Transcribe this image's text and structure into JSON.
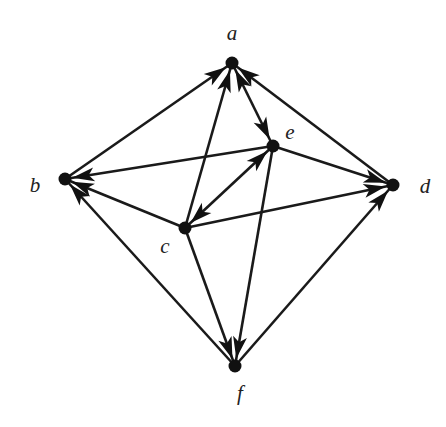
{
  "diagram": {
    "type": "directed-graph",
    "nodes": [
      {
        "id": "a",
        "label": "a",
        "x": 232,
        "y": 63,
        "lx": 232,
        "ly": 40
      },
      {
        "id": "b",
        "label": "b",
        "x": 65,
        "y": 179,
        "lx": 35,
        "ly": 192
      },
      {
        "id": "c",
        "label": "c",
        "x": 185,
        "y": 228,
        "lx": 165,
        "ly": 253
      },
      {
        "id": "d",
        "label": "d",
        "x": 393,
        "y": 185,
        "lx": 425,
        "ly": 193
      },
      {
        "id": "e",
        "label": "e",
        "x": 273,
        "y": 146,
        "lx": 290,
        "ly": 139
      },
      {
        "id": "f",
        "label": "f",
        "x": 235,
        "y": 366,
        "lx": 240,
        "ly": 400
      }
    ],
    "edges": [
      {
        "from": "b",
        "to": "a"
      },
      {
        "from": "c",
        "to": "a"
      },
      {
        "from": "d",
        "to": "a"
      },
      {
        "from": "a",
        "to": "e"
      },
      {
        "from": "e",
        "to": "a"
      },
      {
        "from": "e",
        "to": "b"
      },
      {
        "from": "c",
        "to": "b"
      },
      {
        "from": "f",
        "to": "b"
      },
      {
        "from": "c",
        "to": "e"
      },
      {
        "from": "e",
        "to": "c"
      },
      {
        "from": "e",
        "to": "d"
      },
      {
        "from": "c",
        "to": "d"
      },
      {
        "from": "f",
        "to": "d"
      },
      {
        "from": "c",
        "to": "f"
      },
      {
        "from": "e",
        "to": "f"
      }
    ]
  }
}
